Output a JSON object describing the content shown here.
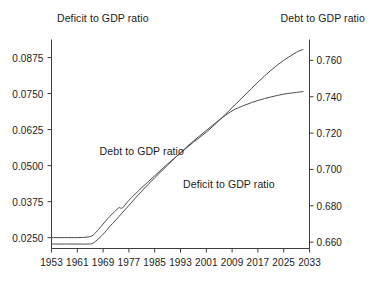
{
  "chart_data": {
    "type": "line",
    "title": "",
    "xlabel": "",
    "left_axis": {
      "title": "Deficit to GDP ratio",
      "ticks": [
        "0.0250",
        "0.0375",
        "0.0500",
        "0.0625",
        "0.0750",
        "0.0875"
      ],
      "tick_values": [
        0.025,
        0.0375,
        0.05,
        0.0625,
        0.075,
        0.0875
      ],
      "ylim": [
        0.02125,
        0.09375
      ]
    },
    "right_axis": {
      "title": "Debt to GDP ratio",
      "ticks": [
        "0.660",
        "0.680",
        "0.700",
        "0.720",
        "0.740",
        "0.760"
      ],
      "tick_values": [
        0.66,
        0.68,
        0.7,
        0.72,
        0.74,
        0.76
      ],
      "ylim": [
        0.6565,
        0.7715
      ]
    },
    "x_ticks": [
      "1953",
      "1961",
      "1969",
      "1977",
      "1985",
      "1993",
      "2001",
      "2009",
      "2017",
      "2025",
      "2033"
    ],
    "x_tick_values": [
      1953,
      1961,
      1969,
      1977,
      1985,
      1993,
      2001,
      2009,
      2017,
      2025,
      2033
    ],
    "xlim": [
      1953,
      2033
    ],
    "grid": false,
    "legend_position": "in-plot-annotations",
    "annotations": [
      {
        "text": "Debt to GDP ratio",
        "x": 1981,
        "y_px_hint": 151
      },
      {
        "text": "Deficit to GDP ratio",
        "x": 2008,
        "y_px_hint": 184
      }
    ],
    "series": [
      {
        "name": "Debt to GDP ratio",
        "axis": "right",
        "color": "#4a4a4a",
        "x": [
          1953,
          1957,
          1961,
          1964,
          1966,
          1969,
          1971,
          1973,
          1974,
          1975,
          1977,
          1981,
          1985,
          1989,
          1993,
          1997,
          2001,
          2005,
          2009,
          2013,
          2017,
          2021,
          2025,
          2029,
          2031
        ],
        "values": [
          0.6625,
          0.6625,
          0.6625,
          0.6628,
          0.664,
          0.67,
          0.674,
          0.6775,
          0.679,
          0.6788,
          0.683,
          0.69,
          0.6965,
          0.703,
          0.709,
          0.715,
          0.7205,
          0.727,
          0.734,
          0.741,
          0.748,
          0.7545,
          0.76,
          0.7645,
          0.766
        ]
      },
      {
        "name": "Deficit to GDP ratio",
        "axis": "left",
        "color": "#4a4a4a",
        "x": [
          1953,
          1957,
          1961,
          1964,
          1966,
          1969,
          1971,
          1973,
          1977,
          1981,
          1985,
          1989,
          1993,
          1997,
          2001,
          2005,
          2009,
          2013,
          2017,
          2021,
          2025,
          2029,
          2031
        ],
        "values": [
          0.0228,
          0.0228,
          0.0228,
          0.0228,
          0.0232,
          0.0262,
          0.0288,
          0.0312,
          0.0362,
          0.0412,
          0.0458,
          0.0502,
          0.0545,
          0.0585,
          0.0622,
          0.0658,
          0.069,
          0.071,
          0.0726,
          0.0738,
          0.0748,
          0.0754,
          0.0757
        ]
      }
    ]
  }
}
